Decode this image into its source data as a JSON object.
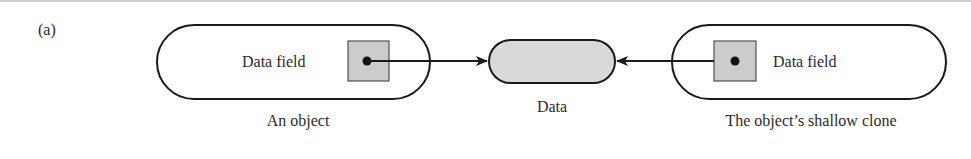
{
  "figure": {
    "panel_label": "(a)",
    "colors": {
      "stroke": "#1a1a1a",
      "fill_gray": "#cccccc",
      "text": "#2a2a2a",
      "background": "#ffffff"
    }
  },
  "nodes": {
    "original": {
      "field_label": "Data field",
      "caption": "An object"
    },
    "data": {
      "caption": "Data"
    },
    "clone": {
      "field_label": "Data field",
      "caption": "The object’s shallow clone"
    }
  },
  "edges": [
    {
      "from": "original.field",
      "to": "data",
      "type": "reference-arrow"
    },
    {
      "from": "clone.field",
      "to": "data",
      "type": "reference-arrow"
    }
  ]
}
